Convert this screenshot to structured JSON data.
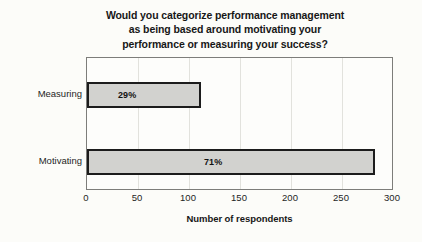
{
  "chart_data": {
    "type": "bar",
    "orientation": "horizontal",
    "title": "Would you categorize performance management as being based around motivating your performance or measuring your success?",
    "title_lines": [
      "Would you categorize performance management",
      "as being based around motivating your",
      "performance or measuring your success?"
    ],
    "categories": [
      "Measuring",
      "Motivating"
    ],
    "values": [
      112,
      283
    ],
    "data_labels": [
      "29%",
      "71%"
    ],
    "xlabel": "Number of respondents",
    "ylabel": "",
    "xlim": [
      0,
      300
    ],
    "xticks": [
      0,
      50,
      100,
      150,
      200,
      250,
      300
    ],
    "xtick_labels": [
      "0",
      "50",
      "100",
      "150",
      "200",
      "250",
      "300"
    ],
    "grid": true,
    "legend": null,
    "colors": {
      "bar_fill": "#d2d2cf",
      "bar_border": "#1c1c1c",
      "plot_background": "#fdfdfb",
      "page_background": "#fcfcf9",
      "gridline": "#e2e2dd",
      "frame": "#7d7d7a",
      "text": "#1f1f1f"
    }
  }
}
